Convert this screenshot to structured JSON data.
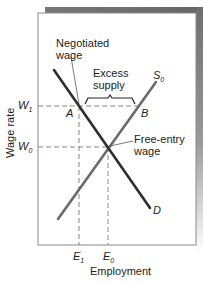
{
  "diagram": {
    "type": "labor-market supply-demand",
    "y_axis_label": "Wage rate",
    "x_axis_label": "Employment",
    "y_ticks": [
      {
        "label": "W",
        "sub": "1",
        "level": "negotiated"
      },
      {
        "label": "W",
        "sub": "0",
        "level": "free-entry"
      }
    ],
    "x_ticks": [
      {
        "label": "E",
        "sub": "1"
      },
      {
        "label": "E",
        "sub": "0"
      }
    ],
    "curves": [
      {
        "name": "S",
        "sub": "0",
        "kind": "supply",
        "color": "#6b6b6b"
      },
      {
        "name": "D",
        "sub": "",
        "kind": "demand",
        "color": "#2e2e2e"
      }
    ],
    "points": [
      {
        "label": "A",
        "desc": "demand at negotiated wage"
      },
      {
        "label": "B",
        "desc": "supply at negotiated wage"
      }
    ],
    "annotations": {
      "negotiated_line1": "Negotiated",
      "negotiated_line2": "wage",
      "excess_line1": "Excess",
      "excess_line2": "supply",
      "free_line1": "Free-entry",
      "free_line2": "wage"
    },
    "colors": {
      "frame": "#8a8a8a",
      "shadow": "#7a7a7a",
      "dash": "#888888",
      "text": "#222222"
    }
  }
}
